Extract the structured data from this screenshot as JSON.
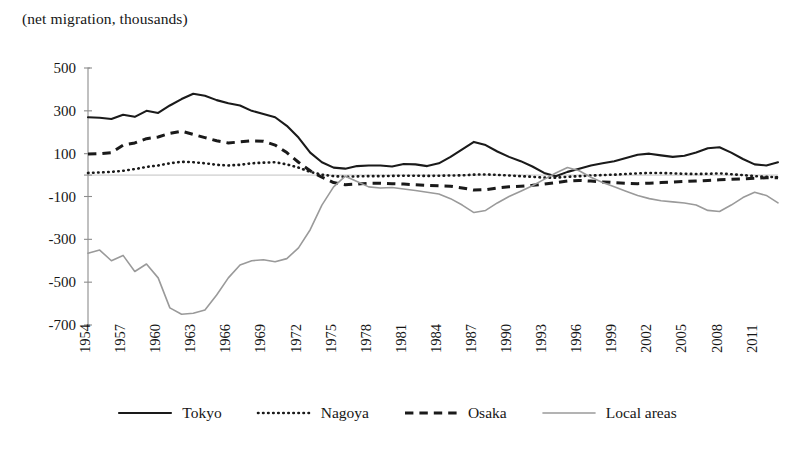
{
  "chart_data": {
    "type": "line",
    "title": "(net migration, thousands)",
    "xlabel": "",
    "ylabel": "",
    "ylim": [
      -700,
      500
    ],
    "yticks": [
      500,
      300,
      100,
      -100,
      -300,
      -500,
      -700
    ],
    "ytick_labels": [
      "500",
      "300",
      "100",
      "-100",
      "-300",
      "-500",
      "-700"
    ],
    "grid": false,
    "legend_position": "bottom",
    "x": [
      1954,
      1955,
      1956,
      1957,
      1958,
      1959,
      1960,
      1961,
      1962,
      1963,
      1964,
      1965,
      1966,
      1967,
      1968,
      1969,
      1970,
      1971,
      1972,
      1973,
      1974,
      1975,
      1976,
      1977,
      1978,
      1979,
      1980,
      1981,
      1982,
      1983,
      1984,
      1985,
      1986,
      1987,
      1988,
      1989,
      1990,
      1991,
      1992,
      1993,
      1994,
      1995,
      1996,
      1997,
      1998,
      1999,
      2000,
      2001,
      2002,
      2003,
      2004,
      2005,
      2006,
      2007,
      2008,
      2009,
      2010,
      2011,
      2012,
      2013
    ],
    "xtick_labels": [
      "1954",
      "1957",
      "1960",
      "1963",
      "1966",
      "1969",
      "1972",
      "1975",
      "1978",
      "1981",
      "1984",
      "1987",
      "1990",
      "1993",
      "1996",
      "1999",
      "2002",
      "2005",
      "2008",
      "2011"
    ],
    "xtick_values": [
      1954,
      1957,
      1960,
      1963,
      1966,
      1969,
      1972,
      1975,
      1978,
      1981,
      1984,
      1987,
      1990,
      1993,
      1996,
      1999,
      2002,
      2005,
      2008,
      2011
    ],
    "series": [
      {
        "name": "Tokyo",
        "style": "solid",
        "color": "#1a1a1a",
        "width": 2.1,
        "values": [
          270,
          268,
          262,
          282,
          272,
          300,
          290,
          325,
          355,
          380,
          370,
          350,
          335,
          325,
          300,
          285,
          270,
          230,
          175,
          105,
          60,
          35,
          30,
          42,
          45,
          45,
          40,
          52,
          50,
          42,
          55,
          85,
          120,
          155,
          140,
          110,
          85,
          65,
          40,
          10,
          -5,
          15,
          30,
          45,
          55,
          65,
          80,
          95,
          100,
          92,
          85,
          90,
          105,
          125,
          130,
          105,
          75,
          50,
          45,
          60
        ]
      },
      {
        "name": "Nagoya",
        "style": "dotted",
        "color": "#1a1a1a",
        "width": 2.6,
        "values": [
          10,
          12,
          15,
          20,
          28,
          38,
          45,
          55,
          62,
          60,
          55,
          48,
          45,
          48,
          55,
          58,
          60,
          50,
          35,
          15,
          2,
          -5,
          -8,
          -6,
          -5,
          -5,
          -4,
          -3,
          -3,
          -4,
          -3,
          -2,
          -1,
          2,
          3,
          1,
          -2,
          -5,
          -8,
          -12,
          -12,
          -8,
          -5,
          -2,
          0,
          2,
          5,
          8,
          10,
          10,
          8,
          6,
          5,
          6,
          8,
          4,
          0,
          -5,
          -8,
          -10
        ]
      },
      {
        "name": "Osaka",
        "style": "dashed",
        "color": "#1a1a1a",
        "width": 3.0,
        "values": [
          98,
          100,
          105,
          140,
          150,
          170,
          178,
          195,
          205,
          190,
          175,
          160,
          150,
          155,
          160,
          158,
          140,
          105,
          60,
          20,
          -10,
          -35,
          -45,
          -42,
          -38,
          -38,
          -40,
          -42,
          -45,
          -48,
          -50,
          -52,
          -60,
          -70,
          -68,
          -60,
          -55,
          -52,
          -48,
          -42,
          -35,
          -28,
          -25,
          -28,
          -32,
          -35,
          -38,
          -40,
          -38,
          -35,
          -32,
          -30,
          -28,
          -25,
          -22,
          -20,
          -18,
          -15,
          -12,
          -12
        ]
      },
      {
        "name": "Local areas",
        "style": "thin-solid",
        "color": "#9a9a9a",
        "width": 1.6,
        "values": [
          -365,
          -350,
          -400,
          -375,
          -450,
          -415,
          -480,
          -620,
          -650,
          -645,
          -630,
          -560,
          -480,
          -420,
          -400,
          -395,
          -405,
          -390,
          -340,
          -255,
          -140,
          -55,
          -5,
          -30,
          -55,
          -60,
          -58,
          -65,
          -72,
          -80,
          -88,
          -110,
          -140,
          -175,
          -165,
          -130,
          -100,
          -75,
          -50,
          -20,
          10,
          35,
          20,
          -10,
          -35,
          -55,
          -75,
          -95,
          -110,
          -120,
          -125,
          -130,
          -140,
          -165,
          -170,
          -140,
          -105,
          -80,
          -95,
          -130
        ]
      }
    ]
  },
  "legend": {
    "items": [
      {
        "label": "Tokyo",
        "style": "solid"
      },
      {
        "label": "Nagoya",
        "style": "dotted"
      },
      {
        "label": "Osaka",
        "style": "dashed"
      },
      {
        "label": "Local areas",
        "style": "thin-solid"
      }
    ]
  }
}
